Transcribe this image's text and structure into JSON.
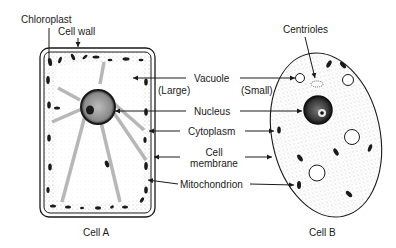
{
  "diagram": {
    "type": "labeled comparison diagram",
    "cells": [
      {
        "id": "A",
        "caption": "Cell A"
      },
      {
        "id": "B",
        "caption": "Cell B"
      }
    ],
    "labels": {
      "chloroplast": "Chloroplast",
      "cell_wall": "Cell wall",
      "centrioles": "Centrioles",
      "vacuole": "Vacuole",
      "vacuole_large": "(Large)",
      "vacuole_small": "(Small)",
      "nucleus": "Nucleus",
      "cytoplasm": "Cytoplasm",
      "cell_membrane_line1": "Cell",
      "cell_membrane_line2": "membrane",
      "mitochondrion": "Mitochondrion"
    },
    "colors": {
      "ink": "#1a1a1a",
      "stipple": "#9a9a9a",
      "background": "#ffffff"
    }
  }
}
